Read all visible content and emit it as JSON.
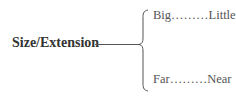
{
  "diagram": {
    "root": {
      "label": "Size/Extension"
    },
    "branches": [
      {
        "label": "Big………Little",
        "left": "Big",
        "right": "Little"
      },
      {
        "label": "Far………Near",
        "left": "Far",
        "right": "Near"
      }
    ],
    "line_color": "#555555"
  }
}
